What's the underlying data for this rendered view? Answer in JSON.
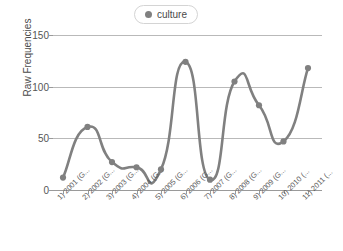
{
  "chart_data": {
    "type": "line",
    "title": "",
    "subtitle": "",
    "xlabel": "",
    "ylabel": "Raw Frequencies",
    "ylim": [
      0,
      150
    ],
    "yticks": [
      0,
      50,
      100,
      150
    ],
    "grid": true,
    "grid_axis": "y",
    "legend_position": "top-center",
    "series_color": "#808080",
    "marker": "circle",
    "smoothing": "spline",
    "categories": [
      "1) 2001 (G...",
      "2) 2002 (G...",
      "3) 2003 (G...",
      "4) 2004 (G...",
      "5) 2005 (G...",
      "6) 2006 (G...",
      "7) 2007 (G...",
      "8) 2008 (G...",
      "9) 2009 (G...",
      "10) 2010 (...",
      "11) 2011 (..."
    ],
    "series": [
      {
        "name": "culture",
        "color": "#808080",
        "values": [
          12,
          61,
          27,
          22,
          20,
          124,
          10,
          105,
          82,
          47,
          118
        ]
      }
    ]
  },
  "legend": {
    "entries": [
      {
        "label": "culture",
        "color": "#808080",
        "marker_icon": "circle-marker-icon"
      }
    ]
  },
  "axes": {
    "y": {
      "title": "Raw Frequencies",
      "tick_labels": [
        "150",
        "100",
        "50",
        "0"
      ]
    },
    "x": {
      "title": "",
      "tick_labels": [
        "1) 2001 (G...",
        "2) 2002 (G...",
        "3) 2003 (G...",
        "4) 2004 (G...",
        "5) 2005 (G...",
        "6) 2006 (G...",
        "7) 2007 (G...",
        "8) 2008 (G...",
        "9) 2009 (G...",
        "10) 2010 (...",
        "11) 2011 (..."
      ]
    }
  },
  "colors": {
    "series": "#808080",
    "gridline": "#b9b9b9",
    "axis": "#9a9a9a",
    "tick_text": "#555555",
    "legend_border": "#d4d4d4",
    "background": "#ffffff"
  }
}
